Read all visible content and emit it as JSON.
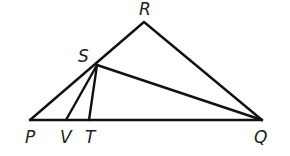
{
  "diagram": {
    "type": "geometry-triangle",
    "colors": {
      "stroke": "#111111",
      "label": "#222222",
      "background": "#ffffff"
    },
    "points": {
      "P": {
        "x": 30,
        "y": 120
      },
      "V": {
        "x": 66,
        "y": 120
      },
      "T": {
        "x": 89,
        "y": 120
      },
      "Q": {
        "x": 262,
        "y": 120
      },
      "R": {
        "x": 144,
        "y": 22
      },
      "S": {
        "x": 97,
        "y": 65
      }
    },
    "segments": [
      [
        "P",
        "Q"
      ],
      [
        "P",
        "R"
      ],
      [
        "R",
        "Q"
      ],
      [
        "S",
        "V"
      ],
      [
        "S",
        "T"
      ],
      [
        "S",
        "Q"
      ]
    ],
    "labels": {
      "R": {
        "text": "R",
        "x": 139,
        "y": 15
      },
      "S": {
        "text": "S",
        "x": 78,
        "y": 62
      },
      "P": {
        "text": "P",
        "x": 25,
        "y": 143
      },
      "V": {
        "text": "V",
        "x": 60,
        "y": 143
      },
      "T": {
        "text": "T",
        "x": 85,
        "y": 143
      },
      "Q": {
        "text": "Q",
        "x": 254,
        "y": 143
      }
    }
  }
}
